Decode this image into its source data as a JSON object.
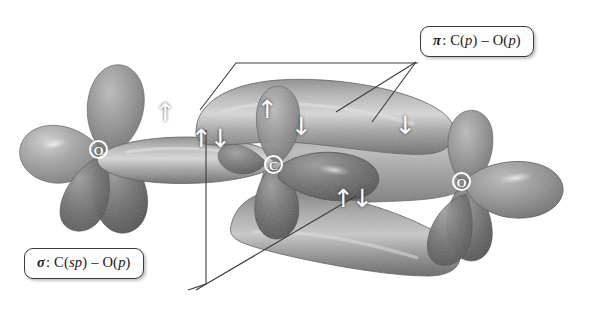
{
  "figure": {
    "background_color": "#ffffff",
    "width": 590,
    "height": 318
  },
  "callouts": [
    {
      "id": "pi",
      "symbol": "π",
      "separator": ":",
      "description": "C(p) – O(p)",
      "full_text": "π: C(p) – O(p)",
      "border_color": "#3a3a3a",
      "background_color": "#fdfdfd"
    },
    {
      "id": "sigma",
      "symbol": "σ",
      "separator": ":",
      "description": "C(sp) – O(p)",
      "full_text": "σ: C(sp) – O(p)",
      "border_color": "#3a3a3a",
      "background_color": "#fdfdfd"
    }
  ],
  "atoms": [
    {
      "id": "o-left",
      "label": "O",
      "element": "oxygen"
    },
    {
      "id": "c-center",
      "label": "C",
      "element": "carbon"
    },
    {
      "id": "o-right",
      "label": "O",
      "element": "oxygen"
    }
  ],
  "electron_spins": [
    {
      "id": "spin-1",
      "glyph": "↑",
      "kind": "single-up"
    },
    {
      "id": "spin-2",
      "glyph": "↑↓",
      "kind": "paired"
    },
    {
      "id": "spin-3",
      "glyph": "↑",
      "kind": "single-up"
    },
    {
      "id": "spin-4",
      "glyph": "↓",
      "kind": "single-down"
    },
    {
      "id": "spin-5",
      "glyph": "↑↓",
      "kind": "paired"
    },
    {
      "id": "spin-6",
      "glyph": "↓",
      "kind": "single-down"
    }
  ],
  "orbital_colors": {
    "surface_light": "#b4b4b4",
    "surface_mid": "#9a9a9a",
    "surface_dark": "#6b6b6b",
    "surface_darkest": "#535353",
    "highlight": "#e2e2e2",
    "leader_line": "#3c3c3c"
  }
}
